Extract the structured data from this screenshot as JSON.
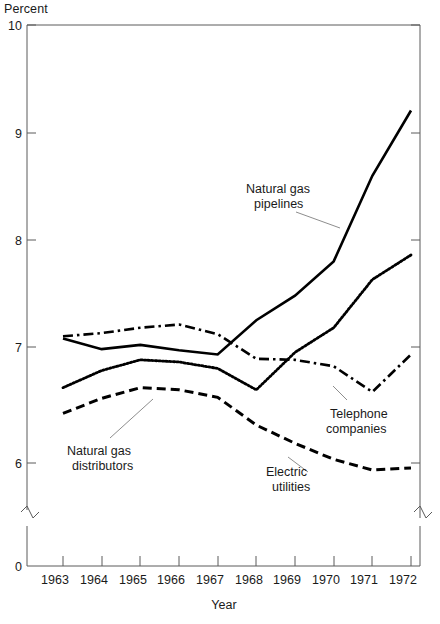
{
  "figure": {
    "faint_top_text": "",
    "y_axis_unit_label": "Percent",
    "x_axis_title": "Year"
  },
  "chart_data": {
    "type": "line",
    "title": "",
    "subtitle": "",
    "xlabel": "Year",
    "ylabel": "Percent",
    "x": [
      1963,
      1964,
      1965,
      1966,
      1967,
      1968,
      1969,
      1970,
      1971,
      1972
    ],
    "x_tick_labels": [
      "1963",
      "1964",
      "1965",
      "1966",
      "1967",
      "1968",
      "1969",
      "1970",
      "1971",
      "1972"
    ],
    "y_tick_labels": [
      "0",
      "6",
      "7",
      "8",
      "9",
      "10"
    ],
    "y_ticks": [
      0,
      6,
      7,
      8,
      9,
      10
    ],
    "ylim": [
      6,
      10
    ],
    "axis_break": true,
    "axis_break_note": "y-axis broken between 0 and 6",
    "grid": false,
    "legend": "none",
    "annotations_style": "inline labels with leader lines",
    "series": [
      {
        "name": "Natural gas pipelines",
        "line_style": "solid",
        "color": "#000000",
        "values": [
          7.08,
          6.98,
          7.02,
          6.97,
          6.93,
          7.25,
          7.48,
          7.8,
          8.6,
          9.21
        ]
      },
      {
        "name": "Telephone companies",
        "line_style": "dash-dot",
        "color": "#000000",
        "values": [
          7.1,
          7.13,
          7.18,
          7.21,
          7.12,
          6.89,
          6.88,
          6.82,
          6.58,
          6.93
        ]
      },
      {
        "name": "Natural gas distributors",
        "line_style": "dotted",
        "color": "#000000",
        "values": [
          6.62,
          6.78,
          6.88,
          6.86,
          6.8,
          6.6,
          6.95,
          7.18,
          7.63,
          7.86
        ]
      },
      {
        "name": "Electric utilities",
        "line_style": "dashed",
        "color": "#000000",
        "values": [
          6.38,
          6.52,
          6.62,
          6.6,
          6.53,
          6.27,
          6.1,
          5.95,
          5.85,
          5.87
        ]
      }
    ]
  },
  "annotations": [
    {
      "id": "natural-gas-pipelines",
      "line1": "Natural gas",
      "line2": "pipelines"
    },
    {
      "id": "telephone-companies",
      "line1": "Telephone",
      "line2": "companies"
    },
    {
      "id": "natural-gas-distributors",
      "line1": "Natural gas",
      "line2": "distributors"
    },
    {
      "id": "electric-utilities",
      "line1": "Electric",
      "line2": "utilities"
    }
  ]
}
